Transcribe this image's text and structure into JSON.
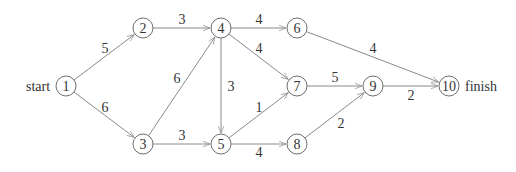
{
  "diagram": {
    "type": "directed-network",
    "start_label": "start",
    "finish_label": "finish",
    "nodes": [
      {
        "id": "1",
        "label": "1",
        "x": 66,
        "y": 86
      },
      {
        "id": "2",
        "label": "2",
        "x": 143,
        "y": 28
      },
      {
        "id": "3",
        "label": "3",
        "x": 143,
        "y": 144
      },
      {
        "id": "4",
        "label": "4",
        "x": 221,
        "y": 28
      },
      {
        "id": "5",
        "label": "5",
        "x": 221,
        "y": 144
      },
      {
        "id": "6",
        "label": "6",
        "x": 297,
        "y": 28
      },
      {
        "id": "7",
        "label": "7",
        "x": 297,
        "y": 86
      },
      {
        "id": "8",
        "label": "8",
        "x": 297,
        "y": 144
      },
      {
        "id": "9",
        "label": "9",
        "x": 373,
        "y": 86
      },
      {
        "id": "10",
        "label": "10",
        "x": 449,
        "y": 86
      }
    ],
    "edges": [
      {
        "from": "1",
        "to": "2",
        "weight": "5",
        "lx": 105,
        "ly": 48
      },
      {
        "from": "1",
        "to": "3",
        "weight": "6",
        "lx": 105,
        "ly": 107
      },
      {
        "from": "2",
        "to": "4",
        "weight": "3",
        "lx": 182,
        "ly": 19
      },
      {
        "from": "3",
        "to": "4",
        "weight": "6",
        "lx": 177,
        "ly": 78
      },
      {
        "from": "3",
        "to": "5",
        "weight": "3",
        "lx": 182,
        "ly": 135
      },
      {
        "from": "4",
        "to": "6",
        "weight": "4",
        "lx": 259,
        "ly": 19
      },
      {
        "from": "4",
        "to": "7",
        "weight": "4",
        "lx": 259,
        "ly": 48
      },
      {
        "from": "4",
        "to": "5",
        "weight": "3",
        "lx": 231,
        "ly": 86
      },
      {
        "from": "5",
        "to": "7",
        "weight": "1",
        "lx": 259,
        "ly": 107
      },
      {
        "from": "5",
        "to": "8",
        "weight": "4",
        "lx": 259,
        "ly": 152
      },
      {
        "from": "6",
        "to": "10",
        "weight": "4",
        "lx": 373,
        "ly": 48
      },
      {
        "from": "7",
        "to": "9",
        "weight": "5",
        "lx": 335,
        "ly": 77
      },
      {
        "from": "8",
        "to": "9",
        "weight": "2",
        "lx": 341,
        "ly": 123
      },
      {
        "from": "9",
        "to": "10",
        "weight": "2",
        "lx": 411,
        "ly": 95
      }
    ]
  }
}
